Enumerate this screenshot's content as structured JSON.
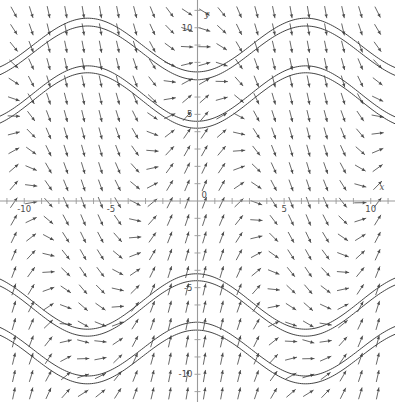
{
  "figure": {
    "kind": "slope-field",
    "width": 395,
    "height": 402,
    "background": "#ffffff",
    "arrow_color": "#4d4d4d",
    "curve_color": "#3a3a3a",
    "axis_color": "#9a9a9a"
  },
  "axes": {
    "x_label": "x",
    "y_label": "y",
    "x_label_pos": {
      "x": 10.65,
      "y": 0.62
    },
    "y_label_pos": {
      "x": 0.55,
      "y": 10.6
    },
    "x_tick_labels": [
      {
        "value": -10,
        "text": "-10"
      },
      {
        "value": -5,
        "text": "-5"
      },
      {
        "value": 5,
        "text": "5"
      },
      {
        "value": 10,
        "text": "10"
      }
    ],
    "y_tick_labels": [
      {
        "value": 10,
        "text": "10"
      },
      {
        "value": 5,
        "text": "5"
      },
      {
        "value": -5,
        "text": "-5"
      },
      {
        "value": -10,
        "text": "-10"
      }
    ],
    "origin_label": "0",
    "minor_ticks_every": 1,
    "grid": false
  },
  "chart_data": {
    "type": "scatter",
    "title": "",
    "subtitle": "",
    "xlabel": "x",
    "ylabel": "y",
    "xlim": [
      -11.4,
      11.4
    ],
    "ylim": [
      -11.6,
      11.6
    ],
    "xticks": [
      -10,
      -5,
      0,
      5,
      10
    ],
    "yticks": [
      -10,
      -5,
      0,
      5,
      10
    ],
    "grid": false,
    "legend": null,
    "plot_kind": "direction-field-with-solution-curves",
    "equation": "dy/dx = cos(x) * sign-like vertical flow field",
    "field": {
      "description": "Arrows of uniform length on a regular lattice; direction rotates with x and y, producing upward columns near x=-7,-1,5,11 and downward columns near x=-10,-4,2,8; near the x-axis arrows are vertical and away from it they tilt toward the sinusoidal separatrices.",
      "grid_spacing_units": 1.0,
      "arrow_length_px": 11.5,
      "x_start": -10.6,
      "x_end": 10.6,
      "y_start": -11.1,
      "y_end": 11.1
    },
    "solution_curves": [
      {
        "id": "curve-upper-1",
        "form": "y = A*sin(B*x + P) + C",
        "amplitude": 1.55,
        "period": 12.6,
        "phase": -1.55,
        "offset": 9.0
      },
      {
        "id": "curve-upper-2",
        "form": "y = A*sin(B*x + P) + C",
        "amplitude": 1.55,
        "period": 12.6,
        "phase": -1.55,
        "offset": 8.55
      },
      {
        "id": "curve-mid-1",
        "form": "y = A*sin(B*x + P) + C",
        "amplitude": 1.6,
        "period": 12.6,
        "phase": -1.55,
        "offset": 6.2
      },
      {
        "id": "curve-mid-2",
        "form": "y = A*sin(B*x + P) + C",
        "amplitude": 1.6,
        "period": 12.6,
        "phase": -1.55,
        "offset": 5.8
      },
      {
        "id": "curve-low-1",
        "form": "y = A*sin(B*x + P) + C",
        "amplitude": 1.6,
        "period": 12.6,
        "phase": 1.6,
        "offset": -6.2
      },
      {
        "id": "curve-low-2",
        "form": "y = A*sin(B*x + P) + C",
        "amplitude": 1.6,
        "period": 12.6,
        "phase": 1.6,
        "offset": -5.8
      },
      {
        "id": "curve-bottom-1",
        "form": "y = A*sin(B*x + P) + C",
        "amplitude": 1.55,
        "period": 12.6,
        "phase": 1.6,
        "offset": -9.0
      },
      {
        "id": "curve-bottom-2",
        "form": "y = A*sin(B*x + P) + C",
        "amplitude": 1.55,
        "period": 12.6,
        "phase": 1.6,
        "offset": -8.55
      }
    ]
  }
}
